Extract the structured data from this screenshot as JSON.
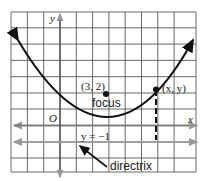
{
  "diagram": {
    "labels": {
      "y_axis": "y",
      "x_axis": "x",
      "origin": "O",
      "focus_coords": "(3, 2)",
      "focus": "focus",
      "point": "(x, y)",
      "directrix_eq": "y = −1",
      "directrix": "directrix"
    },
    "geometry": {
      "focus": [
        3,
        2
      ],
      "vertex": [
        3,
        0.5
      ],
      "directrix_y": -1,
      "grid_x_range": [
        -3,
        8
      ],
      "grid_y_range": [
        -3,
        7
      ]
    },
    "colors": {
      "grid": "#333333",
      "curve": "#111111",
      "axis_arrow": "#888888",
      "background": "#ffffff"
    }
  }
}
